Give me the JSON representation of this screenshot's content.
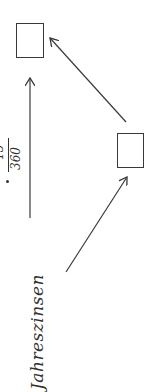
{
  "diagram": {
    "orientation": "rotated -90deg (text reads bottom-to-top)",
    "nodes": [
      {
        "id": "box-top",
        "label": "",
        "shape": "empty-rectangle"
      },
      {
        "id": "box-right",
        "label": "",
        "shape": "empty-rectangle"
      }
    ],
    "edges": [
      {
        "from": "origin-lower-left",
        "to": "box-right",
        "label": ""
      },
      {
        "from": "box-right",
        "to": "box-top",
        "label": ""
      },
      {
        "from": "origin-lower-left",
        "to": "box-top",
        "label": "Jahreszinsen · ?/360"
      }
    ],
    "labels": {
      "main": "Jahreszinsen",
      "multiply_dot": "·",
      "fraction_numerator": "15",
      "fraction_denominator": "360"
    },
    "colors": {
      "stroke": "#3a3a3a",
      "text": "#333333",
      "background": "#ffffff"
    }
  }
}
